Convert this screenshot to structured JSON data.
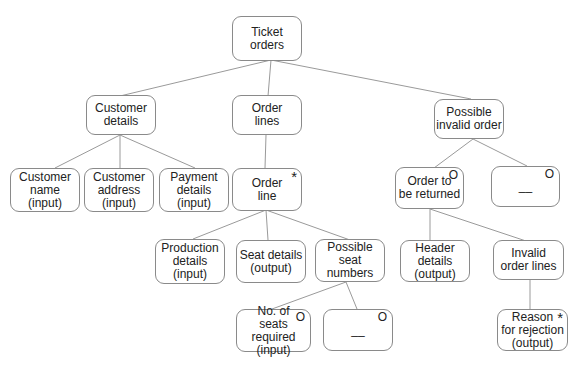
{
  "diagram": {
    "type": "jackson-structure-diagram",
    "nodes": [
      {
        "id": "ticket-orders",
        "label": "Ticket\norders",
        "marker": ""
      },
      {
        "id": "customer-details",
        "label": "Customer\ndetails",
        "marker": ""
      },
      {
        "id": "order-lines",
        "label": "Order\nlines",
        "marker": ""
      },
      {
        "id": "possible-invalid-order",
        "label": "Possible\ninvalid order",
        "marker": ""
      },
      {
        "id": "customer-name",
        "label": "Customer\nname\n(input)",
        "marker": ""
      },
      {
        "id": "customer-address",
        "label": "Customer\naddress\n(input)",
        "marker": ""
      },
      {
        "id": "payment-details",
        "label": "Payment\ndetails\n(input)",
        "marker": ""
      },
      {
        "id": "order-line",
        "label": "Order\nline",
        "marker": "*"
      },
      {
        "id": "order-to-be-returned",
        "label": "Order to\nbe returned",
        "marker": "O"
      },
      {
        "id": "empty-option-1",
        "label": "__",
        "marker": "O"
      },
      {
        "id": "production-details",
        "label": "Production\ndetails\n(input)",
        "marker": ""
      },
      {
        "id": "seat-details",
        "label": "Seat details\n(output)",
        "marker": ""
      },
      {
        "id": "possible-seat-numbers",
        "label": "Possible\nseat numbers",
        "marker": ""
      },
      {
        "id": "header-details",
        "label": "Header\ndetails\n(output)",
        "marker": ""
      },
      {
        "id": "invalid-order-lines",
        "label": "Invalid\norder lines",
        "marker": ""
      },
      {
        "id": "no-of-seats-required",
        "label": "No. of\nseats required\n(input)",
        "marker": "O"
      },
      {
        "id": "empty-option-2",
        "label": "__",
        "marker": "O"
      },
      {
        "id": "reason-for-rejection",
        "label": "Reason\nfor rejection\n(output)",
        "marker": "*"
      }
    ],
    "edges": [
      [
        "ticket-orders",
        "customer-details"
      ],
      [
        "ticket-orders",
        "order-lines"
      ],
      [
        "ticket-orders",
        "possible-invalid-order"
      ],
      [
        "customer-details",
        "customer-name"
      ],
      [
        "customer-details",
        "customer-address"
      ],
      [
        "customer-details",
        "payment-details"
      ],
      [
        "order-lines",
        "order-line"
      ],
      [
        "order-line",
        "production-details"
      ],
      [
        "order-line",
        "seat-details"
      ],
      [
        "order-line",
        "possible-seat-numbers"
      ],
      [
        "possible-seat-numbers",
        "no-of-seats-required"
      ],
      [
        "possible-seat-numbers",
        "empty-option-2"
      ],
      [
        "possible-invalid-order",
        "order-to-be-returned"
      ],
      [
        "possible-invalid-order",
        "empty-option-1"
      ],
      [
        "order-to-be-returned",
        "header-details"
      ],
      [
        "order-to-be-returned",
        "invalid-order-lines"
      ],
      [
        "invalid-order-lines",
        "reason-for-rejection"
      ]
    ]
  }
}
